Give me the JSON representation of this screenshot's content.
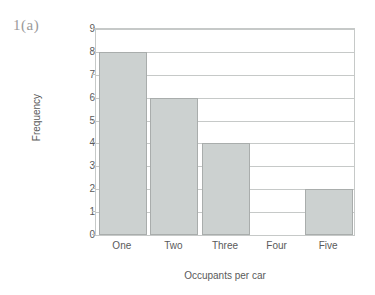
{
  "figure_label": "1(a)",
  "chart_data": {
    "type": "bar",
    "title": "",
    "xlabel": "Occupants per car",
    "ylabel": "Frequency",
    "categories": [
      "One",
      "Two",
      "Three",
      "Four",
      "Five"
    ],
    "values": [
      8,
      6,
      4,
      0,
      2
    ],
    "ylim": [
      0,
      9
    ],
    "yticks": [
      0,
      1,
      2,
      3,
      4,
      5,
      6,
      7,
      8,
      9
    ],
    "ytick_labels": [
      "0",
      "1",
      "2",
      "3",
      "4",
      "5",
      "6",
      "7",
      "8",
      "9"
    ],
    "grid": "horizontal",
    "legend": "none",
    "bar_fill_color": "#ccd1d0",
    "bar_edge_color": "#a9adac",
    "axis_color": "#c6c9c8",
    "text_color": "#5a5a5a"
  }
}
